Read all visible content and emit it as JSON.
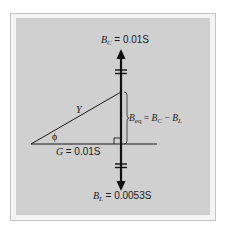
{
  "figure": {
    "background_color": "#d0d0d0",
    "frame_color": "#c4c4c4",
    "line_color": "#1a1a1a",
    "labels": {
      "bc_symbol": "B",
      "bc_sub": "C",
      "bc_value": "= 0.01S",
      "bl_symbol": "B",
      "bl_sub": "L",
      "bl_value": "= 0.0053S",
      "g_symbol": "G",
      "g_value": "= 0.01S",
      "y_symbol": "Y",
      "phi_symbol": "ϕ",
      "beq_symbol": "B",
      "beq_sub": "eq",
      "beq_eq": "=",
      "beq_rhs1_symbol": "B",
      "beq_rhs1_sub": "C",
      "beq_minus": "−",
      "beq_rhs2_symbol": "B",
      "beq_rhs2_sub": "L"
    }
  }
}
